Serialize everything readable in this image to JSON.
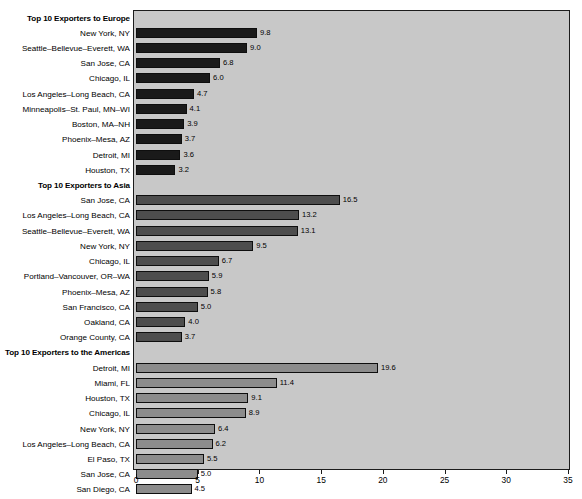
{
  "chart_data": {
    "type": "bar",
    "orientation": "horizontal",
    "title": "",
    "xlabel": "",
    "ylabel": "",
    "xlim": [
      0,
      35
    ],
    "xticks": [
      0,
      5,
      10,
      15,
      20,
      25,
      30,
      35
    ],
    "xtick_labels": [
      "0",
      "5",
      "10",
      "15",
      "20",
      "25",
      "30",
      "35"
    ],
    "grid": false,
    "legend": "none",
    "plot_background_color": "#c8c8c8",
    "groups": [
      {
        "header": "Top 10 Exporters to Europe",
        "bar_color": "#1a1a1a",
        "categories": [
          "New York, NY",
          "Seattle–Bellevue–Everett, WA",
          "San Jose, CA",
          "Chicago, IL",
          "Los Angeles–Long Beach, CA",
          "Minneapolis–St. Paul, MN–WI",
          "Boston, MA–NH",
          "Phoenix–Mesa, AZ",
          "Detroit, MI",
          "Houston, TX"
        ],
        "values": [
          9.8,
          9.0,
          6.8,
          6.0,
          4.7,
          4.1,
          3.9,
          3.7,
          3.6,
          3.2
        ],
        "value_labels": [
          "9.8",
          "9.0",
          "6.8",
          "6.0",
          "4.7",
          "4.1",
          "3.9",
          "3.7",
          "3.6",
          "3.2"
        ]
      },
      {
        "header": "Top 10 Exporters to Asia",
        "bar_color": "#4d4d4d",
        "categories": [
          "San Jose, CA",
          "Los Angeles–Long Beach, CA",
          "Seattle–Bellevue–Everett, WA",
          "New York, NY",
          "Chicago, IL",
          "Portland–Vancouver, OR–WA",
          "Phoenix–Mesa, AZ",
          "San Francisco, CA",
          "Oakland, CA",
          "Orange County, CA"
        ],
        "values": [
          16.5,
          13.2,
          13.1,
          9.5,
          6.7,
          5.9,
          5.8,
          5.0,
          4.0,
          3.7
        ],
        "value_labels": [
          "16.5",
          "13.2",
          "13.1",
          "9.5",
          "6.7",
          "5.9",
          "5.8",
          "5.0",
          "4.0",
          "3.7"
        ]
      },
      {
        "header": "Top 10 Exporters to the Americas",
        "bar_color": "#8c8c8c",
        "categories": [
          "Detroit, MI",
          "Miami, FL",
          "Houston, TX",
          "Chicago, IL",
          "New York, NY",
          "Los Angeles–Long Beach, CA",
          "El Paso, TX",
          "San Jose, CA",
          "San Diego, CA",
          "Laredo, TX"
        ],
        "values": [
          19.6,
          11.4,
          9.1,
          8.9,
          6.4,
          6.2,
          5.5,
          5.0,
          4.5,
          3.9
        ],
        "value_labels": [
          "19.6",
          "11.4",
          "9.1",
          "8.9",
          "6.4",
          "6.2",
          "5.5",
          "5.0",
          "4.5",
          "3.9"
        ]
      }
    ]
  }
}
